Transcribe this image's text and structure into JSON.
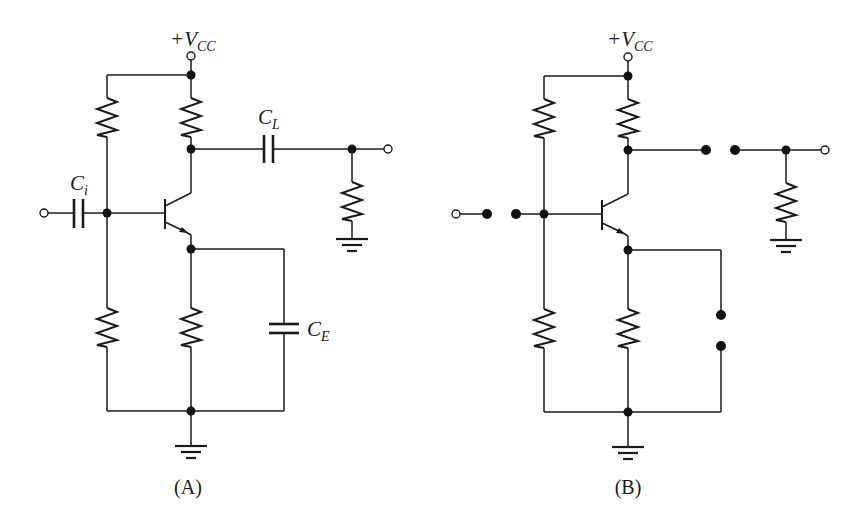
{
  "figure": {
    "background": "#ffffff",
    "ink_color": "#1a1a1a",
    "circuits": [
      {
        "id": "A",
        "caption": "(A)",
        "supply_label": {
          "prefix": "+V",
          "sub": "CC"
        },
        "input_cap_label": {
          "main": "C",
          "sub": "i"
        },
        "load_cap_label": {
          "main": "C",
          "sub": "L"
        },
        "emitter_cap_label": {
          "main": "C",
          "sub": "E"
        },
        "variant": "with-capacitors"
      },
      {
        "id": "B",
        "caption": "(B)",
        "supply_label": {
          "prefix": "+V",
          "sub": "CC"
        },
        "variant": "capacitors-open"
      }
    ]
  }
}
